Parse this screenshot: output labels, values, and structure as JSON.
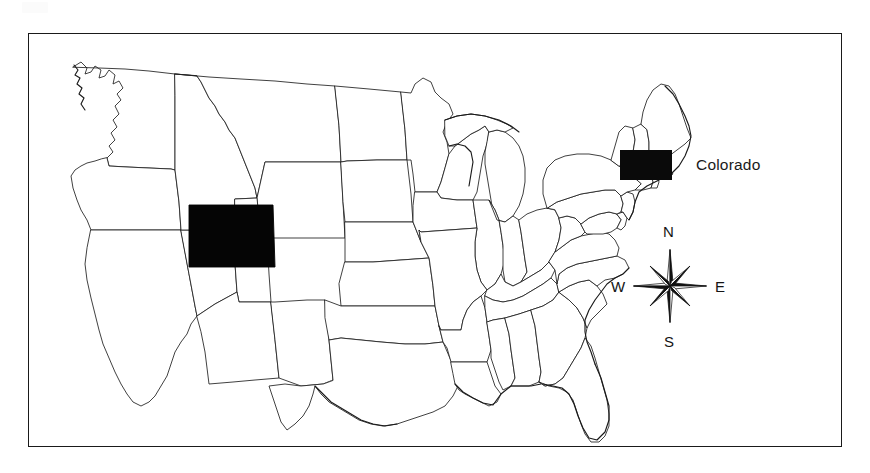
{
  "figure": {
    "type": "choropleth-locator-map",
    "region": "United States (contiguous 48 states)",
    "has_frame": true,
    "frame_color": "#1a1a1a",
    "background_color": "#ffffff"
  },
  "legend": {
    "swatch_color": "#0a0a0a",
    "label": "Colorado"
  },
  "compass": {
    "name": "compass-rose",
    "points": 8,
    "north_label": "N",
    "south_label": "S",
    "east_label": "E",
    "west_label": "W",
    "color": "#141414"
  },
  "highlighted": {
    "state": "Colorado",
    "fill": "#050505"
  },
  "map_data": {
    "outline_color": "#1f1f1f",
    "state_fill": "#ffffff",
    "highlight_fill": "#050505",
    "states_shown": "contiguous-48"
  }
}
